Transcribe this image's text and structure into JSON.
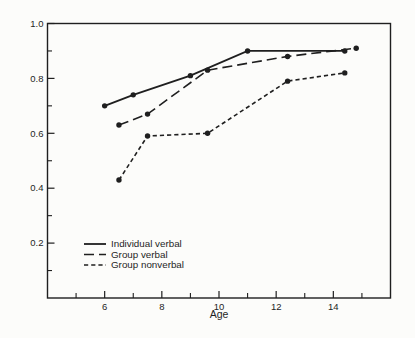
{
  "figure": {
    "background": "#fcfcfa",
    "ink_color": "#1f1f1f"
  },
  "chart_data": {
    "type": "line",
    "title": "",
    "xlabel": "Age",
    "ylabel": "",
    "xlim": [
      4,
      16
    ],
    "ylim": [
      0,
      1.0
    ],
    "grid": false,
    "legend_position": "inside-lower-left",
    "x_labeled_ticks": [
      6,
      8,
      10,
      12,
      14
    ],
    "x_tick_labels": [
      "6",
      "8",
      "10",
      "12",
      "14"
    ],
    "x_minor_ticks": [
      5,
      7,
      9,
      11,
      13,
      15
    ],
    "y_labeled_ticks": [
      0.2,
      0.4,
      0.6,
      0.8,
      1.0
    ],
    "y_tick_labels": [
      "0.2",
      "0.4",
      "0.6",
      "0.8",
      "1.0"
    ],
    "y_minor_ticks": [
      0.1,
      0.3,
      0.5,
      0.7,
      0.9
    ],
    "series": [
      {
        "name": "Individual verbal",
        "line_style": "solid",
        "marker": "filled-circle",
        "points": [
          [
            6,
            0.7
          ],
          [
            7,
            0.74
          ],
          [
            9,
            0.81
          ],
          [
            11,
            0.9
          ],
          [
            14.4,
            0.9
          ]
        ]
      },
      {
        "name": "Group verbal",
        "line_style": "long-dash",
        "marker": "filled-circle",
        "points": [
          [
            6.5,
            0.63
          ],
          [
            7.5,
            0.67
          ],
          [
            9.6,
            0.83
          ],
          [
            12.4,
            0.88
          ],
          [
            14.8,
            0.91
          ]
        ]
      },
      {
        "name": "Group nonverbal",
        "line_style": "short-dash",
        "marker": "filled-circle",
        "points": [
          [
            6.5,
            0.43
          ],
          [
            7.5,
            0.59
          ],
          [
            9.6,
            0.6
          ],
          [
            12.4,
            0.79
          ],
          [
            14.4,
            0.82
          ]
        ]
      }
    ]
  }
}
